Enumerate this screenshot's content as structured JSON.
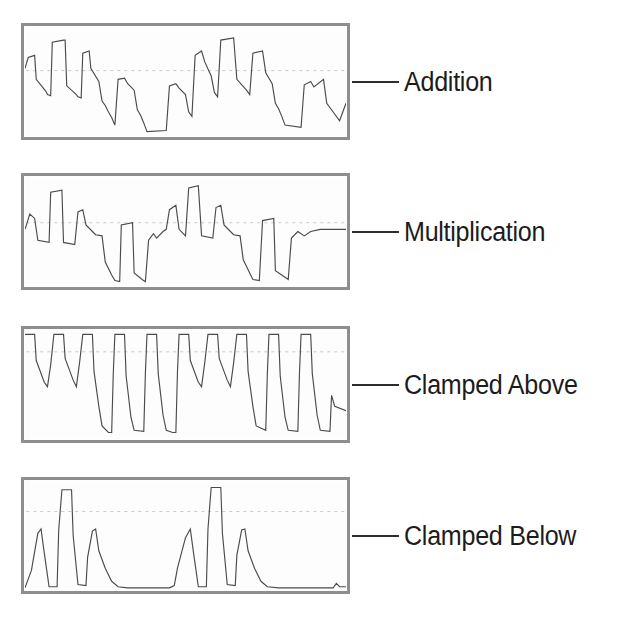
{
  "figure": {
    "panel_count": 4,
    "panel_border_color": "#8e8e8e",
    "wave_stroke_color": "#4b4b4b",
    "midline_color": "#bdbdbd",
    "label_color": "#1c1c1c",
    "background": "#ffffff"
  },
  "panels": [
    {
      "label": "Addition",
      "operation": "addition",
      "callout": true,
      "midline": true,
      "midline_y": 0.6,
      "panel_top": 27
    },
    {
      "label": "Multiplication",
      "operation": "multiplication",
      "callout": true,
      "midline": true,
      "midline_y": 0.58,
      "panel_top": 177
    },
    {
      "label": "Clamped Above",
      "operation": "clamped-above",
      "callout": true,
      "midline": true,
      "midline_y": 0.8,
      "panel_top": 330
    },
    {
      "label": "Clamped Below",
      "operation": "clamped-below",
      "callout": true,
      "midline": true,
      "midline_y": 0.72,
      "panel_top": 481
    }
  ],
  "chart_data": {
    "type": "line",
    "xlabel": "",
    "ylabel": "",
    "grid": false,
    "legend_position": "right-callout",
    "axis_ranges": {
      "x": [
        0,
        100
      ],
      "y": [
        0,
        1
      ]
    },
    "series": [
      {
        "name": "Addition",
        "note": "Square wave added to descending ramp segments; result shows stepped peaks and troughs, roughly two repeating macro-cycles across the panel.",
        "points": [
          [
            0.0,
            0.62
          ],
          [
            1.0,
            0.72
          ],
          [
            3.0,
            0.74
          ],
          [
            3.5,
            0.52
          ],
          [
            6.5,
            0.41
          ],
          [
            7.0,
            0.38
          ],
          [
            8.0,
            0.37
          ],
          [
            8.5,
            0.86
          ],
          [
            12.0,
            0.88
          ],
          [
            12.5,
            0.88
          ],
          [
            13.0,
            0.46
          ],
          [
            16.0,
            0.38
          ],
          [
            16.5,
            0.36
          ],
          [
            17.5,
            0.35
          ],
          [
            18.0,
            0.76
          ],
          [
            20.0,
            0.78
          ],
          [
            20.5,
            0.62
          ],
          [
            23.0,
            0.5
          ],
          [
            24.0,
            0.32
          ],
          [
            25.0,
            0.28
          ],
          [
            26.0,
            0.22
          ],
          [
            27.0,
            0.17
          ],
          [
            28.0,
            0.1
          ],
          [
            29.0,
            0.52
          ],
          [
            31.0,
            0.53
          ],
          [
            32.0,
            0.48
          ],
          [
            34.0,
            0.42
          ],
          [
            35.0,
            0.24
          ],
          [
            36.0,
            0.19
          ],
          [
            37.0,
            0.12
          ],
          [
            38.0,
            0.04
          ],
          [
            44.0,
            0.05
          ],
          [
            45.0,
            0.46
          ],
          [
            47.0,
            0.48
          ],
          [
            48.0,
            0.44
          ],
          [
            50.0,
            0.38
          ],
          [
            51.0,
            0.22
          ],
          [
            52.0,
            0.18
          ],
          [
            53.0,
            0.74
          ],
          [
            55.0,
            0.78
          ],
          [
            56.0,
            0.68
          ],
          [
            58.0,
            0.55
          ],
          [
            59.0,
            0.4
          ],
          [
            60.0,
            0.36
          ],
          [
            61.0,
            0.88
          ],
          [
            65.0,
            0.9
          ],
          [
            66.0,
            0.52
          ],
          [
            69.0,
            0.42
          ],
          [
            70.0,
            0.38
          ],
          [
            71.0,
            0.76
          ],
          [
            74.0,
            0.78
          ],
          [
            75.0,
            0.58
          ],
          [
            77.0,
            0.48
          ],
          [
            78.0,
            0.3
          ],
          [
            79.0,
            0.25
          ],
          [
            80.0,
            0.18
          ],
          [
            81.0,
            0.1
          ],
          [
            86.0,
            0.08
          ],
          [
            87.0,
            0.47
          ],
          [
            89.0,
            0.5
          ],
          [
            90.0,
            0.45
          ],
          [
            93.0,
            0.52
          ],
          [
            94.0,
            0.3
          ],
          [
            96.0,
            0.22
          ],
          [
            98.0,
            0.14
          ],
          [
            100.0,
            0.3
          ]
        ]
      },
      {
        "name": "Multiplication",
        "note": "Square wave multiplied with ramp; peaks are sharper triangular, deep narrow troughs where square goes low.",
        "points": [
          [
            0.0,
            0.52
          ],
          [
            1.5,
            0.66
          ],
          [
            3.0,
            0.62
          ],
          [
            4.0,
            0.42
          ],
          [
            7.5,
            0.4
          ],
          [
            8.0,
            0.86
          ],
          [
            11.5,
            0.88
          ],
          [
            12.0,
            0.4
          ],
          [
            15.5,
            0.38
          ],
          [
            16.5,
            0.68
          ],
          [
            18.0,
            0.7
          ],
          [
            19.0,
            0.56
          ],
          [
            21.0,
            0.5
          ],
          [
            22.0,
            0.47
          ],
          [
            24.0,
            0.46
          ],
          [
            25.0,
            0.22
          ],
          [
            27.0,
            0.1
          ],
          [
            28.0,
            0.05
          ],
          [
            29.5,
            0.04
          ],
          [
            30.0,
            0.56
          ],
          [
            33.5,
            0.58
          ],
          [
            34.0,
            0.12
          ],
          [
            36.5,
            0.06
          ],
          [
            37.5,
            0.04
          ],
          [
            38.5,
            0.42
          ],
          [
            40.0,
            0.48
          ],
          [
            41.0,
            0.44
          ],
          [
            43.0,
            0.5
          ],
          [
            44.0,
            0.52
          ],
          [
            45.0,
            0.7
          ],
          [
            47.0,
            0.74
          ],
          [
            48.0,
            0.52
          ],
          [
            50.0,
            0.46
          ],
          [
            51.0,
            0.9
          ],
          [
            54.0,
            0.92
          ],
          [
            55.0,
            0.46
          ],
          [
            58.5,
            0.44
          ],
          [
            59.5,
            0.72
          ],
          [
            61.0,
            0.74
          ],
          [
            62.0,
            0.56
          ],
          [
            64.0,
            0.5
          ],
          [
            65.0,
            0.47
          ],
          [
            67.0,
            0.46
          ],
          [
            68.0,
            0.24
          ],
          [
            70.0,
            0.12
          ],
          [
            71.0,
            0.06
          ],
          [
            73.0,
            0.05
          ],
          [
            74.0,
            0.6
          ],
          [
            77.5,
            0.62
          ],
          [
            78.0,
            0.14
          ],
          [
            81.0,
            0.08
          ],
          [
            82.0,
            0.06
          ],
          [
            83.0,
            0.44
          ],
          [
            85.0,
            0.5
          ],
          [
            87.0,
            0.46
          ],
          [
            89.0,
            0.5
          ],
          [
            92.0,
            0.52
          ],
          [
            100.0,
            0.52
          ]
        ]
      },
      {
        "name": "Clamped Above",
        "note": "Result clipped at a high ceiling; tops are flat at the maximum, with V-shaped dips and full-depth square troughs.",
        "points": [
          [
            0.0,
            0.96
          ],
          [
            3.0,
            0.96
          ],
          [
            3.5,
            0.72
          ],
          [
            6.0,
            0.52
          ],
          [
            7.0,
            0.48
          ],
          [
            8.0,
            0.68
          ],
          [
            9.0,
            0.96
          ],
          [
            12.0,
            0.96
          ],
          [
            12.5,
            0.74
          ],
          [
            15.0,
            0.54
          ],
          [
            16.0,
            0.48
          ],
          [
            17.0,
            0.7
          ],
          [
            18.0,
            0.96
          ],
          [
            21.0,
            0.96
          ],
          [
            21.5,
            0.62
          ],
          [
            23.0,
            0.3
          ],
          [
            24.0,
            0.12
          ],
          [
            26.0,
            0.06
          ],
          [
            27.0,
            0.06
          ],
          [
            27.5,
            0.6
          ],
          [
            28.0,
            0.96
          ],
          [
            31.0,
            0.96
          ],
          [
            31.5,
            0.58
          ],
          [
            33.0,
            0.2
          ],
          [
            34.0,
            0.08
          ],
          [
            37.0,
            0.07
          ],
          [
            37.5,
            0.6
          ],
          [
            38.0,
            0.96
          ],
          [
            41.0,
            0.96
          ],
          [
            41.5,
            0.6
          ],
          [
            43.0,
            0.22
          ],
          [
            44.0,
            0.08
          ],
          [
            46.0,
            0.06
          ],
          [
            47.0,
            0.06
          ],
          [
            47.5,
            0.62
          ],
          [
            48.0,
            0.96
          ],
          [
            51.0,
            0.96
          ],
          [
            51.5,
            0.72
          ],
          [
            54.0,
            0.52
          ],
          [
            55.0,
            0.48
          ],
          [
            56.0,
            0.7
          ],
          [
            57.0,
            0.96
          ],
          [
            60.0,
            0.96
          ],
          [
            60.5,
            0.74
          ],
          [
            63.0,
            0.54
          ],
          [
            64.0,
            0.48
          ],
          [
            65.0,
            0.7
          ],
          [
            66.0,
            0.96
          ],
          [
            69.0,
            0.96
          ],
          [
            69.5,
            0.62
          ],
          [
            71.0,
            0.3
          ],
          [
            72.0,
            0.12
          ],
          [
            75.0,
            0.08
          ],
          [
            75.5,
            0.6
          ],
          [
            76.0,
            0.96
          ],
          [
            79.0,
            0.96
          ],
          [
            79.5,
            0.58
          ],
          [
            81.0,
            0.2
          ],
          [
            82.0,
            0.08
          ],
          [
            85.0,
            0.07
          ],
          [
            85.5,
            0.6
          ],
          [
            86.0,
            0.96
          ],
          [
            89.0,
            0.96
          ],
          [
            89.5,
            0.6
          ],
          [
            91.0,
            0.22
          ],
          [
            92.0,
            0.08
          ],
          [
            95.0,
            0.07
          ],
          [
            95.5,
            0.4
          ],
          [
            96.5,
            0.3
          ],
          [
            100.0,
            0.26
          ]
        ]
      },
      {
        "name": "Clamped Below",
        "note": "Result clipped at a low floor; most of the trace sits flat on the floor, with isolated triangular and square-topped bursts.",
        "points": [
          [
            0.0,
            0.02
          ],
          [
            2.0,
            0.18
          ],
          [
            4.0,
            0.52
          ],
          [
            5.0,
            0.56
          ],
          [
            6.0,
            0.34
          ],
          [
            7.5,
            0.03
          ],
          [
            10.0,
            0.03
          ],
          [
            10.5,
            0.55
          ],
          [
            11.5,
            0.92
          ],
          [
            14.5,
            0.92
          ],
          [
            15.0,
            0.5
          ],
          [
            16.5,
            0.05
          ],
          [
            19.0,
            0.04
          ],
          [
            19.5,
            0.3
          ],
          [
            21.0,
            0.54
          ],
          [
            22.0,
            0.56
          ],
          [
            23.0,
            0.36
          ],
          [
            25.0,
            0.2
          ],
          [
            27.0,
            0.08
          ],
          [
            29.0,
            0.03
          ],
          [
            32.0,
            0.02
          ],
          [
            45.0,
            0.02
          ],
          [
            46.5,
            0.04
          ],
          [
            47.5,
            0.2
          ],
          [
            50.0,
            0.48
          ],
          [
            51.5,
            0.56
          ],
          [
            52.5,
            0.34
          ],
          [
            54.0,
            0.03
          ],
          [
            56.5,
            0.03
          ],
          [
            57.0,
            0.56
          ],
          [
            58.0,
            0.94
          ],
          [
            61.0,
            0.94
          ],
          [
            61.5,
            0.52
          ],
          [
            63.0,
            0.05
          ],
          [
            65.5,
            0.04
          ],
          [
            66.0,
            0.32
          ],
          [
            67.5,
            0.55
          ],
          [
            68.5,
            0.56
          ],
          [
            69.5,
            0.36
          ],
          [
            71.5,
            0.2
          ],
          [
            73.5,
            0.08
          ],
          [
            75.5,
            0.03
          ],
          [
            79.0,
            0.02
          ],
          [
            96.0,
            0.02
          ],
          [
            97.0,
            0.06
          ],
          [
            98.0,
            0.03
          ],
          [
            100.0,
            0.03
          ]
        ]
      }
    ]
  }
}
